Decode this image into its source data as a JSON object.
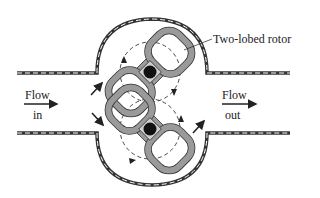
{
  "diagram": {
    "labels": {
      "rotor": "Two-lobed rotor",
      "flow_in_1": "Flow",
      "flow_in_2": "in",
      "flow_out_1": "Flow",
      "flow_out_2": "out"
    },
    "colors": {
      "rotor_fill": "#9a9a9a",
      "rotor_stroke": "#333333",
      "hub": "#111111",
      "wall": "#333333",
      "background": "#ffffff"
    }
  }
}
